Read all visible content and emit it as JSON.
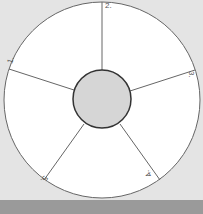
{
  "diagram": {
    "type": "segmented-wheel",
    "segments": [
      {
        "label": "1."
      },
      {
        "label": "2."
      },
      {
        "label": "3."
      },
      {
        "label": "4."
      },
      {
        "label": "5."
      }
    ],
    "colors": {
      "background": "#e4e4e4",
      "wheel_fill": "#ffffff",
      "hub_fill": "#d6d6d6",
      "line": "#555555",
      "bottom_band": "#9a9a9a"
    }
  }
}
